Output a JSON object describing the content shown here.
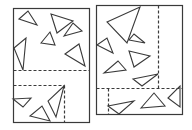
{
  "diagram": {
    "stroke_color": "#3a3a3a",
    "background": "#ffffff",
    "panels": [
      {
        "name": "left-panel",
        "rect": [
          13,
          8,
          76,
          114
        ],
        "dashed_lines": [
          [
            13,
            70,
            89,
            70
          ],
          [
            13,
            85,
            64,
            85
          ],
          [
            64,
            85,
            64,
            122
          ]
        ],
        "triangles": [
          [
            [
              19,
              19
            ],
            [
              28,
              11
            ],
            [
              37,
              25
            ]
          ],
          [
            [
              51,
              14
            ],
            [
              73,
              21
            ],
            [
              57,
              33
            ]
          ],
          [
            [
              64,
              36
            ],
            [
              82,
              31
            ],
            [
              73,
              23
            ]
          ],
          [
            [
              41,
              43
            ],
            [
              55,
              45
            ],
            [
              50,
              32
            ]
          ],
          [
            [
              14,
              48
            ],
            [
              26,
              38
            ],
            [
              23,
              70
            ]
          ],
          [
            [
              65,
              54
            ],
            [
              85,
              66
            ],
            [
              79,
              44
            ]
          ],
          [
            [
              13,
              99
            ],
            [
              31,
              98
            ],
            [
              23,
              107
            ]
          ],
          [
            [
              30,
              116
            ],
            [
              50,
              121
            ],
            [
              42,
              106
            ]
          ],
          [
            [
              48,
              101
            ],
            [
              56,
              117
            ],
            [
              64,
              86
            ]
          ]
        ]
      },
      {
        "name": "right-panel",
        "rect": [
          96,
          5,
          86,
          109
        ],
        "dashed_lines": [
          [
            158,
            5,
            158,
            88
          ],
          [
            96,
            88,
            182,
            88
          ],
          [
            108,
            88,
            108,
            114
          ]
        ],
        "triangles": [
          [
            [
              107,
              22
            ],
            [
              140,
              7
            ],
            [
              127,
              43
            ]
          ],
          [
            [
              97,
              45
            ],
            [
              107,
              38
            ],
            [
              113,
              53
            ]
          ],
          [
            [
              129,
              40
            ],
            [
              145,
              43
            ],
            [
              134,
              34
            ]
          ],
          [
            [
              129,
              51
            ],
            [
              150,
              56
            ],
            [
              134,
              67
            ]
          ],
          [
            [
              104,
              73
            ],
            [
              126,
              70
            ],
            [
              118,
              61
            ]
          ],
          [
            [
              133,
              79
            ],
            [
              158,
              74
            ],
            [
              142,
              86
            ]
          ],
          [
            [
              108,
              106
            ],
            [
              134,
              101
            ],
            [
              119,
              114
            ]
          ],
          [
            [
              141,
              108
            ],
            [
              165,
              106
            ],
            [
              154,
              93
            ]
          ],
          [
            [
              168,
              98
            ],
            [
              180,
              107
            ],
            [
              180,
              86
            ]
          ]
        ]
      }
    ]
  }
}
